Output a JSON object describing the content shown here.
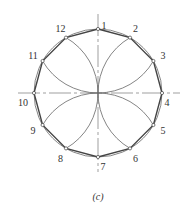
{
  "diagram": {
    "caption": "(c)",
    "center": [
      98,
      93
    ],
    "radius": 64,
    "colors": {
      "stroke": "#555555",
      "polygon": "#444444",
      "axis": "#777777",
      "text": "#333333"
    },
    "points": [
      {
        "label": "1",
        "angle": 90
      },
      {
        "label": "2",
        "angle": 60
      },
      {
        "label": "3",
        "angle": 30
      },
      {
        "label": "4",
        "angle": 0
      },
      {
        "label": "5",
        "angle": -30
      },
      {
        "label": "6",
        "angle": -60
      },
      {
        "label": "7",
        "angle": -90
      },
      {
        "label": "8",
        "angle": -120
      },
      {
        "label": "9",
        "angle": -150
      },
      {
        "label": "10",
        "angle": 180
      },
      {
        "label": "11",
        "angle": 150
      },
      {
        "label": "12",
        "angle": 120
      }
    ],
    "arc_centers": [
      "1",
      "4",
      "7",
      "10"
    ]
  }
}
